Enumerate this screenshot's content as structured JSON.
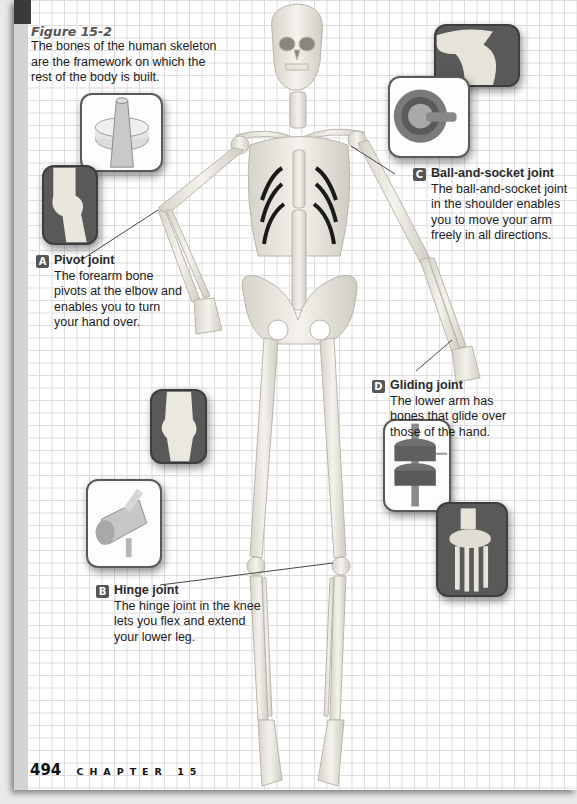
{
  "figure": {
    "number": "Figure 15-2",
    "caption": "The bones of the human skeleton are the framework on which the rest of the body is built."
  },
  "joints": [
    {
      "badge": "A",
      "title": "Pivot joint",
      "description": "The forearm bone pivots at the elbow and enables you to turn your hand over."
    },
    {
      "badge": "B",
      "title": "Hinge joint",
      "description": "The hinge joint in the knee lets you flex and extend your lower leg."
    },
    {
      "badge": "C",
      "title": "Ball-and-socket joint",
      "description": "The ball-and-socket joint in the shoulder enables you to move your arm freely in all directions."
    },
    {
      "badge": "D",
      "title": "Gliding joint",
      "description": "The lower arm has bones that glide over those of the hand."
    }
  ],
  "footer": {
    "page_number": "494",
    "chapter_label": "CHAPTER 15"
  },
  "colors": {
    "grid_line": "#dcdcdc",
    "badge_bg": "#555555",
    "bone": "#ece9e1",
    "inset_dark": "#595959"
  }
}
